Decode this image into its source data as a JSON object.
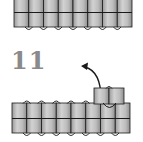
{
  "diagram": {
    "step_label": "11",
    "colors": {
      "block_fill_light": "#c8c8c8",
      "block_fill_dark": "#9a9a9a",
      "line": "#1a1a1a",
      "step_number": "#8a8a8a",
      "arrow": "#1a1a1a"
    },
    "top_row": {
      "columns": 8,
      "rows": 2
    },
    "bottom_row": {
      "columns": 8,
      "rows": 2,
      "raised_block_columns": 2
    },
    "arrow": {
      "direction": "curved-up-left"
    }
  }
}
